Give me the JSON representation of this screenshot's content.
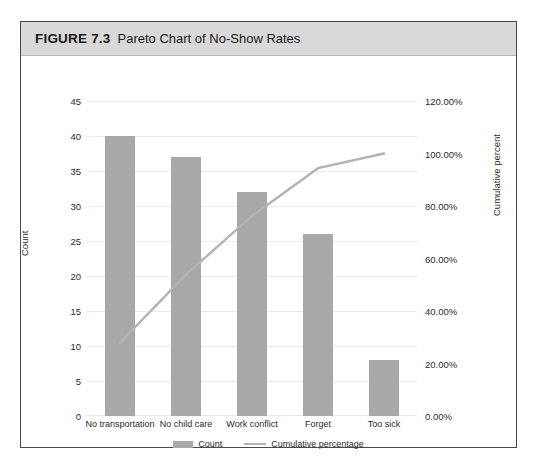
{
  "figure": {
    "number": "FIGURE 7.3",
    "caption": "Pareto Chart of No-Show Rates"
  },
  "chart_data": {
    "type": "bar",
    "title": "Pareto Chart of No-Show Rates",
    "categories": [
      "No transportation",
      "No child care",
      "Work conflict",
      "Forget",
      "Too sick"
    ],
    "series": [
      {
        "name": "Count",
        "type": "bar",
        "axis": "left",
        "values": [
          40,
          37,
          32,
          26,
          8
        ],
        "color": "#a8a8a8"
      },
      {
        "name": "Cumulative percentage",
        "type": "line",
        "axis": "right",
        "values": [
          27.97,
          53.85,
          76.22,
          94.41,
          100.0
        ],
        "color": "#b3b3b3"
      }
    ],
    "xlabel": "",
    "ylabel": "Count",
    "y2label": "Cumulative percent",
    "ylim": [
      0,
      45
    ],
    "y2lim": [
      0,
      120
    ],
    "yticks": [
      "0",
      "5",
      "10",
      "15",
      "20",
      "25",
      "30",
      "35",
      "40",
      "45"
    ],
    "y2ticks": [
      "0.00%",
      "20.00%",
      "40.00%",
      "60.00%",
      "80.00%",
      "100.00%",
      "120.00%"
    ],
    "grid": true,
    "legend": [
      "Count",
      "Cumulative percentage"
    ],
    "legend_position": "bottom"
  }
}
